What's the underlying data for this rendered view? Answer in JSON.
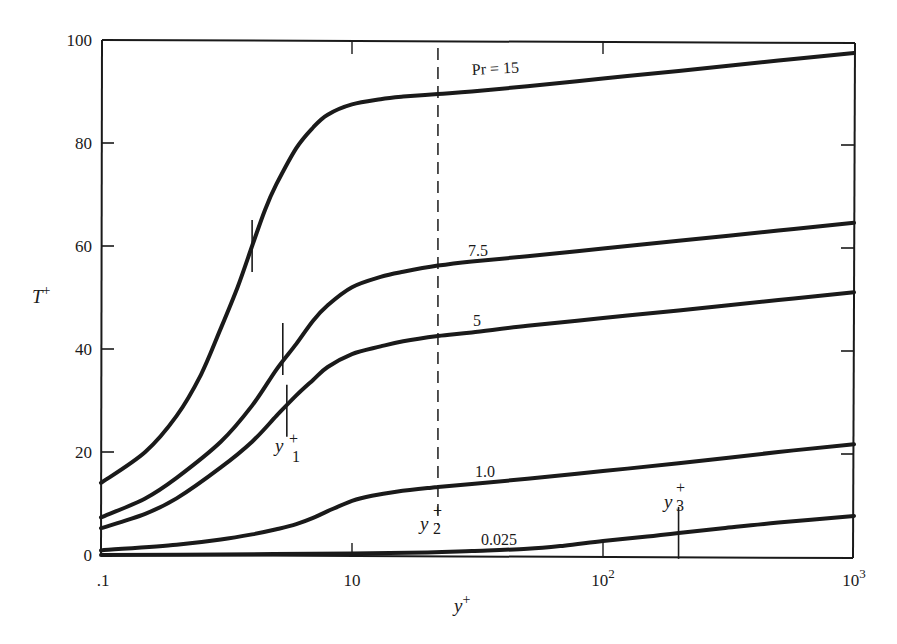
{
  "chart_data": {
    "type": "line",
    "title": "",
    "xlabel": "y+",
    "ylabel": "T+",
    "xscale": "log",
    "xlim": [
      1,
      1000
    ],
    "ylim": [
      0,
      100
    ],
    "grid": false,
    "legend": "inline curve labels",
    "x_ticks": [
      {
        "value": 1,
        "label": ".1"
      },
      {
        "value": 10,
        "label": "10"
      },
      {
        "value": 100,
        "label": "10",
        "sup": "2"
      },
      {
        "value": 1000,
        "label": "10",
        "sup": "3"
      }
    ],
    "y_ticks": [
      {
        "value": 0,
        "label": "0"
      },
      {
        "value": 20,
        "label": "20"
      },
      {
        "value": 40,
        "label": "40"
      },
      {
        "value": 60,
        "label": "60"
      },
      {
        "value": 80,
        "label": "80"
      },
      {
        "value": 100,
        "label": "100"
      }
    ],
    "series": [
      {
        "name": "Pr = 15",
        "label": "Pr = 15",
        "x": [
          1,
          1.5,
          2,
          2.5,
          3,
          3.5,
          4,
          4.5,
          5,
          6,
          7,
          8,
          10,
          13,
          16,
          22,
          30,
          50,
          100,
          200,
          500,
          1000
        ],
        "y": [
          14,
          20,
          27,
          35,
          44,
          52,
          60,
          67,
          72,
          79,
          83,
          85.5,
          87.5,
          88.5,
          89,
          89.5,
          90,
          91,
          92.5,
          94,
          96,
          97.5
        ]
      },
      {
        "name": "Pr = 7.5",
        "label": "7.5",
        "x": [
          1,
          1.5,
          2,
          3,
          4,
          5,
          6,
          7,
          8,
          10,
          13,
          16,
          22,
          30,
          50,
          100,
          200,
          500,
          1000
        ],
        "y": [
          7.3,
          11,
          15,
          22,
          29,
          36,
          41,
          45.5,
          48.5,
          52,
          54,
          55,
          56.2,
          57,
          58,
          59.5,
          61,
          63,
          64.5
        ]
      },
      {
        "name": "Pr = 5",
        "label": "5",
        "x": [
          1,
          1.5,
          2,
          3,
          4,
          5,
          6,
          7,
          8,
          10,
          13,
          16,
          22,
          30,
          50,
          100,
          200,
          500,
          1000
        ],
        "y": [
          5.2,
          8,
          11,
          17,
          22,
          27,
          31,
          34,
          36.5,
          39,
          40.5,
          41.5,
          42.5,
          43.2,
          44.5,
          46,
          47.5,
          49.5,
          51
        ]
      },
      {
        "name": "Pr = 1.0",
        "label": "1.0",
        "x": [
          1,
          2,
          3,
          4,
          5,
          6,
          7,
          8,
          10,
          12,
          15,
          20,
          22,
          30,
          50,
          100,
          200,
          500,
          1000
        ],
        "y": [
          0.9,
          2,
          3,
          4,
          5,
          6,
          7.2,
          8.5,
          10.5,
          11.5,
          12.3,
          13,
          13.2,
          13.8,
          14.8,
          16.3,
          17.8,
          20,
          21.5
        ]
      },
      {
        "name": "Pr = 0.025",
        "label": "0.025",
        "x": [
          1,
          3,
          10,
          20,
          30,
          50,
          70,
          100,
          150,
          200,
          300,
          500,
          1000
        ],
        "y": [
          0,
          0.1,
          0.3,
          0.5,
          0.8,
          1.2,
          1.8,
          2.7,
          3.6,
          4.3,
          5.2,
          6.3,
          7.6
        ]
      }
    ],
    "annotations": [
      {
        "type": "marker",
        "label": "y1+",
        "series": "Pr = 5",
        "x": 5.5,
        "y": 28
      },
      {
        "type": "marker",
        "series": "Pr = 7.5",
        "x": 5.3,
        "y": 40
      },
      {
        "type": "marker",
        "series": "Pr = 15",
        "x": 4,
        "y": 60
      },
      {
        "type": "vline-dashed",
        "label": "y2+",
        "x": 22
      },
      {
        "type": "marker",
        "label": "y3+",
        "series": "Pr = 0.025",
        "x": 200,
        "y": 4.3
      }
    ]
  },
  "labels": {
    "y_axis_title": "T",
    "y_axis_title_sup": "+",
    "x_axis_title": "y",
    "x_axis_title_sup": "+",
    "y1_base": "y",
    "y1_sup": "+",
    "y1_sub": "1",
    "y2_base": "y",
    "y2_sup": "+",
    "y2_sub": "2",
    "y3_base": "y",
    "y3_sup": "+",
    "y3_sub": "3"
  }
}
